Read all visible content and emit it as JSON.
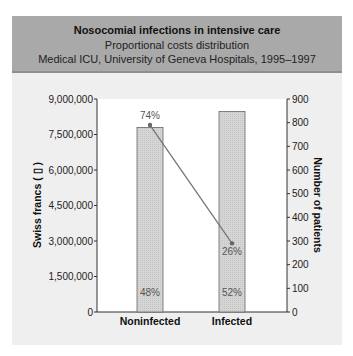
{
  "header": {
    "title": "Nosocomial infections in intensive care",
    "subtitle": "Proportional costs distribution",
    "subtitle2": "Medical ICU, University of Geneva Hospitals, 1995–1997"
  },
  "colors": {
    "header_bg": "#a9a9a9",
    "panel_bg": "#efefef",
    "plot_bg": "#ffffff",
    "bar_fill": "#d4d4d4",
    "bar_stroke": "#666666",
    "line": "#777777"
  },
  "chart_data": {
    "type": "bar",
    "title": "Nosocomial infections in intensive care",
    "subtitle": "Proportional costs distribution — Medical ICU, University of Geneva Hospitals, 1995–1997",
    "categories": [
      "Noninfected",
      "Infected"
    ],
    "series": [
      {
        "name": "Swiss francs",
        "type": "bar",
        "axis": "left",
        "values": [
          7800000,
          8470000
        ],
        "labels": [
          "48%",
          "52%"
        ]
      },
      {
        "name": "Number of patients",
        "type": "line",
        "axis": "right",
        "values": [
          790,
          290
        ],
        "labels": [
          "74%",
          "26%"
        ]
      }
    ],
    "ylabel": "Swiss francs ( ▯ )",
    "y2label": "Number of patients",
    "xlabel": "",
    "ylim": [
      0,
      9000000
    ],
    "y2lim": [
      0,
      900
    ],
    "yticks": [
      "0",
      "1,500,000",
      "3,000,000",
      "4,500,000",
      "6,000,000",
      "7,500,000",
      "9,000,000"
    ],
    "y2ticks": [
      "0",
      "100",
      "200",
      "300",
      "400",
      "500",
      "600",
      "700",
      "800",
      "900"
    ],
    "grid": false,
    "legend": "none"
  }
}
